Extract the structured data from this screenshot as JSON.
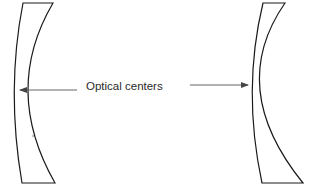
{
  "diagram": {
    "label": "Optical centers",
    "lenses": [
      {
        "name": "left-lens",
        "type": "meniscus-concave"
      },
      {
        "name": "right-lens",
        "type": "meniscus-concave"
      }
    ],
    "arrows": [
      {
        "name": "left-arrow",
        "direction": "left",
        "points_to": "left-lens optical center"
      },
      {
        "name": "right-arrow",
        "direction": "right",
        "points_to": "right-lens optical center"
      }
    ],
    "colors": {
      "line": "#1a1a1a",
      "arrow": "#444444",
      "background": "#ffffff"
    }
  }
}
